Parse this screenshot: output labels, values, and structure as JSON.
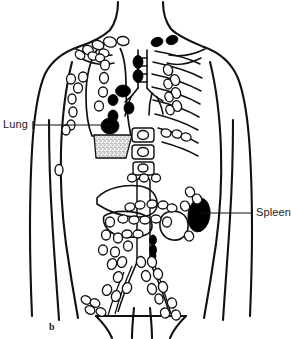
{
  "figure": {
    "letter": "b",
    "background_color": "#ffffff",
    "ink_color": "#111111",
    "involved_node_color": "#000000",
    "uninvolved_node_color": "#ffffff",
    "width": 291,
    "height": 339
  },
  "annotations": [
    {
      "id": "lung",
      "label": "Lung",
      "side": "left",
      "text_x": 3,
      "text_y": 119,
      "leader_from_x": 33,
      "leader_to_x": 110,
      "leader_y": 125
    },
    {
      "id": "spleen",
      "label": "Spleen",
      "side": "right",
      "text_x": 256,
      "text_y": 207,
      "leader_from_x": 200,
      "leader_to_x": 252,
      "leader_y": 213
    }
  ],
  "regions": [
    {
      "name": "supraclavicular-nodes",
      "status": "involved"
    },
    {
      "name": "axillary-nodes-left",
      "status": "uninvolved"
    },
    {
      "name": "mediastinal-nodes",
      "status": "involved"
    },
    {
      "name": "hilar-nodes",
      "status": "involved"
    },
    {
      "name": "lung-lesion",
      "status": "involved"
    },
    {
      "name": "pleural-effusion",
      "status": "stippled"
    },
    {
      "name": "ribs-right",
      "status": "uninvolved"
    },
    {
      "name": "vertebral-bodies",
      "status": "uninvolved"
    },
    {
      "name": "liver",
      "status": "uninvolved"
    },
    {
      "name": "spleen-organ",
      "status": "involved"
    },
    {
      "name": "para-aortic-nodes",
      "status": "mixed"
    },
    {
      "name": "mesenteric-nodes",
      "status": "uninvolved"
    },
    {
      "name": "iliac-nodes",
      "status": "uninvolved"
    },
    {
      "name": "inguinal-nodes",
      "status": "uninvolved"
    }
  ]
}
